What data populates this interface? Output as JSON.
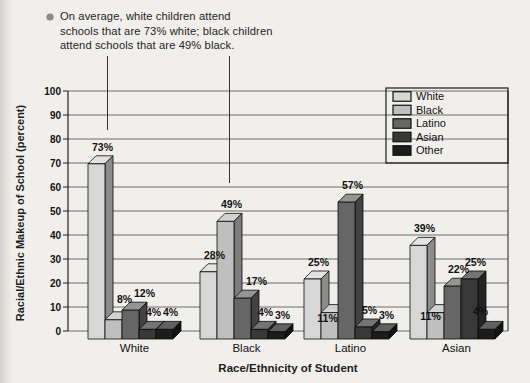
{
  "page": {
    "background": "#f1efec"
  },
  "annotation": {
    "bullet_icon": "filled-circle",
    "text": "On average, white children attend\nschools that are 73% white; black children\nattend schools that are 49% black."
  },
  "chart_data": {
    "type": "bar",
    "variant": "3d-grouped-column",
    "title": "",
    "xlabel": "Race/Ethnicity of Student",
    "ylabel": "Racial/Ethnic Makeup of School (percent)",
    "ylim": [
      0,
      100
    ],
    "ytick_step": 10,
    "grid": true,
    "legend_position": "top-right",
    "value_label_format": "{v}%",
    "categories": [
      "White",
      "Black",
      "Latino",
      "Asian"
    ],
    "series": [
      {
        "name": "White",
        "color": "#d7d7d7",
        "values": [
          73,
          28,
          25,
          39
        ]
      },
      {
        "name": "Black",
        "color": "#bfbfbf",
        "values": [
          8,
          49,
          11,
          11
        ]
      },
      {
        "name": "Latino",
        "color": "#666666",
        "values": [
          12,
          17,
          57,
          22
        ]
      },
      {
        "name": "Asian",
        "color": "#383838",
        "values": [
          4,
          4,
          5,
          25
        ]
      },
      {
        "name": "Other",
        "color": "#1c1c1c",
        "values": [
          4,
          3,
          3,
          4
        ]
      }
    ],
    "annotation_callouts": [
      {
        "target": "White students — 73% White-school bar"
      },
      {
        "target": "Black students — 49% Black-school bar"
      }
    ]
  }
}
